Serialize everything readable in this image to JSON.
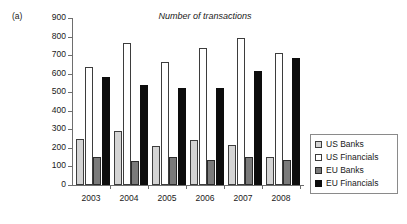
{
  "panel": {
    "label": "(a)"
  },
  "chart_data": {
    "type": "bar",
    "title": "Number of transactions",
    "xlabel": "",
    "ylabel": "",
    "ylim": [
      0,
      900
    ],
    "ytick_step": 100,
    "yticks": [
      900,
      800,
      700,
      600,
      500,
      400,
      300,
      200,
      100,
      0
    ],
    "grid": false,
    "legend_position": "right",
    "categories": [
      "2003",
      "2004",
      "2005",
      "2006",
      "2007",
      "2008"
    ],
    "series": [
      {
        "name": "US Banks",
        "color": "#d4d4d4",
        "values": [
          247,
          290,
          212,
          240,
          218,
          152
        ]
      },
      {
        "name": "US Financials",
        "color": "#ffffff",
        "values": [
          635,
          763,
          663,
          740,
          792,
          710
        ]
      },
      {
        "name": "EU Banks",
        "color": "#7a7a7a",
        "values": [
          150,
          128,
          153,
          137,
          152,
          137
        ]
      },
      {
        "name": "EU Financials",
        "color": "#0d0d0d",
        "values": [
          580,
          538,
          523,
          524,
          612,
          684
        ]
      }
    ]
  }
}
